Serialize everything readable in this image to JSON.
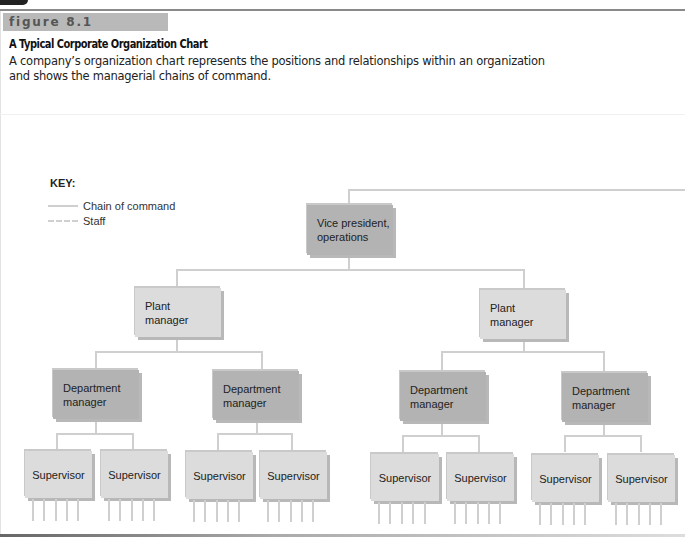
{
  "figure": {
    "label": "figure 8.1",
    "title": "A Typical Corporate Organization Chart",
    "description_lines": [
      "A company’s organization chart represents the positions and relationships within an organization",
      "and shows the managerial chains of command."
    ]
  },
  "key": {
    "title": "KEY:",
    "items": [
      {
        "label": "Chain of command",
        "style": "solid"
      },
      {
        "label": "Staff",
        "style": "dashed"
      }
    ]
  },
  "colors": {
    "line": "#cfcfcf",
    "box_light": "#dcdcdc",
    "box_dark": "#b3b3b3",
    "header_band": "#b9b9b9"
  },
  "org": {
    "vp": {
      "label": "Vice president,\noperations"
    },
    "plant_managers": [
      {
        "label": "Plant\nmanager"
      },
      {
        "label": "Plant\nmanager"
      }
    ],
    "department_managers": [
      {
        "label": "Department\nmanager"
      },
      {
        "label": "Department\nmanager"
      },
      {
        "label": "Department\nmanager"
      },
      {
        "label": "Department\nmanager"
      }
    ],
    "supervisors": [
      {
        "label": "Supervisor"
      },
      {
        "label": "Supervisor"
      },
      {
        "label": "Supervisor"
      },
      {
        "label": "Supervisor"
      },
      {
        "label": "Supervisor"
      },
      {
        "label": "Supervisor"
      },
      {
        "label": "Supervisor"
      },
      {
        "label": "Supervisor"
      }
    ],
    "subordinates_per_supervisor": 5
  }
}
